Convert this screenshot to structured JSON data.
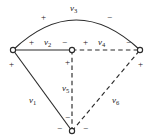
{
  "figure": {
    "name": "planar-graph-branch-voltages",
    "background": "#ffffff",
    "stroke": "#2b2b2b",
    "width": 153,
    "height": 139
  },
  "nodes": [
    {
      "id": "n-left",
      "name": "node-left",
      "x": 13,
      "y": 50,
      "r": 2.6
    },
    {
      "id": "n-middle",
      "name": "node-middle",
      "x": 72,
      "y": 50,
      "r": 2.6
    },
    {
      "id": "n-right",
      "name": "node-right",
      "x": 140,
      "y": 50,
      "r": 2.6
    },
    {
      "id": "n-bottom",
      "name": "node-bottom",
      "x": 72,
      "y": 131,
      "r": 2.6
    }
  ],
  "edges": [
    {
      "id": "e1",
      "label": "v",
      "sub": "1",
      "style": "solid",
      "kind": "line",
      "from": "n-left",
      "to": "n-bottom"
    },
    {
      "id": "e2",
      "label": "v",
      "sub": "2",
      "style": "solid",
      "kind": "line",
      "from": "n-left",
      "to": "n-middle"
    },
    {
      "id": "e3",
      "label": "v",
      "sub": "3",
      "style": "solid",
      "kind": "arc",
      "from": "n-left",
      "to": "n-right"
    },
    {
      "id": "e4",
      "label": "v",
      "sub": "4",
      "style": "dashed",
      "kind": "line",
      "from": "n-middle",
      "to": "n-right"
    },
    {
      "id": "e5",
      "label": "v",
      "sub": "5",
      "style": "dashed",
      "kind": "line",
      "from": "n-middle",
      "to": "n-bottom"
    },
    {
      "id": "e6",
      "label": "v",
      "sub": "6",
      "style": "dashed",
      "kind": "line",
      "from": "n-bottom",
      "to": "n-right"
    }
  ],
  "edge_labels": [
    {
      "name": "edge-label-v1",
      "text": "v",
      "sub": "1",
      "x": 29,
      "y": 96
    },
    {
      "name": "edge-label-v2",
      "text": "v",
      "sub": "2",
      "x": 44,
      "y": 38
    },
    {
      "name": "edge-label-v3",
      "text": "v",
      "sub": "3",
      "x": 70,
      "y": 4
    },
    {
      "name": "edge-label-v4",
      "text": "v",
      "sub": "4",
      "x": 98,
      "y": 38
    },
    {
      "name": "edge-label-v5",
      "text": "v",
      "sub": "5",
      "x": 62,
      "y": 84
    },
    {
      "name": "edge-label-v6",
      "text": "v",
      "sub": "6",
      "x": 112,
      "y": 96
    }
  ],
  "polarity_marks": [
    {
      "name": "polarity-v3-plus",
      "sign": "+",
      "x": 41,
      "y": 13
    },
    {
      "name": "polarity-v3-minus",
      "sign": "−",
      "x": 107,
      "y": 13
    },
    {
      "name": "polarity-v2-plus",
      "sign": "+",
      "x": 29,
      "y": 38
    },
    {
      "name": "polarity-v2-minus",
      "sign": "−",
      "x": 62,
      "y": 38
    },
    {
      "name": "polarity-v4-plus",
      "sign": "+",
      "x": 83,
      "y": 38
    },
    {
      "name": "polarity-v4-minus",
      "sign": "−",
      "x": 126,
      "y": 38
    },
    {
      "name": "polarity-v1-plus",
      "sign": "+",
      "x": 9,
      "y": 60
    },
    {
      "name": "polarity-v5-plus",
      "sign": "+",
      "x": 65,
      "y": 58
    },
    {
      "name": "polarity-v6-plus",
      "sign": "+",
      "x": 138,
      "y": 60
    },
    {
      "name": "polarity-v5-minus",
      "sign": "−",
      "x": 65,
      "y": 113
    },
    {
      "name": "polarity-v1-minus",
      "sign": "−",
      "x": 57,
      "y": 124
    },
    {
      "name": "polarity-v6-minus",
      "sign": "−",
      "x": 83,
      "y": 124
    }
  ],
  "geometry": {
    "arc_v3_path": "M 13 50 Q 76 -10 140 50",
    "solid_color": "#2b2b2b",
    "dash_pattern": "4.5,3.2",
    "line_width": 1.15,
    "node_fill": "#ffffff"
  }
}
